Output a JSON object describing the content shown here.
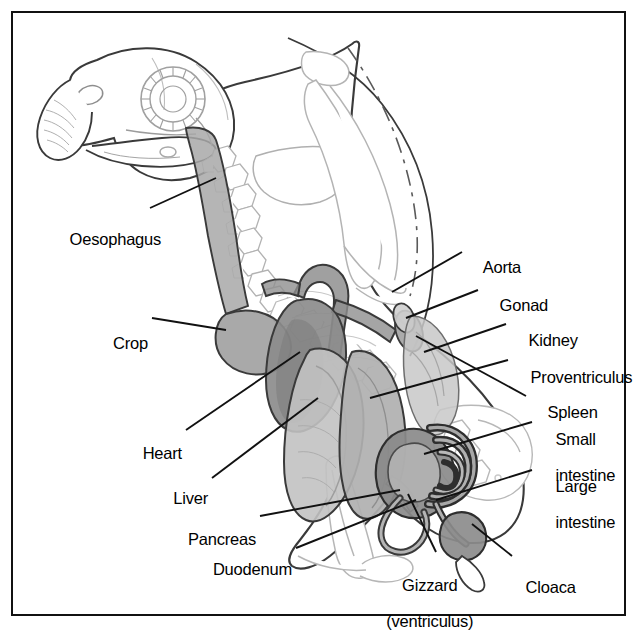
{
  "figure": {
    "frame_color": "#111111",
    "background": "#ffffff",
    "label_color": "#000000"
  },
  "palette": {
    "outline_dark": "#3a3a3a",
    "skeleton_line": "#b9b9b9",
    "organ_dark": "#8f8f8f",
    "organ_mid": "#a8a8a8",
    "organ_light": "#c4c4c4",
    "organ_pale": "#d8d8d8",
    "leader_line": "#111111"
  },
  "labels": [
    {
      "id": "oesophagus",
      "text": "Oesophagus",
      "side": "left",
      "x": 52,
      "y": 212,
      "lines": [
        "Oesophagus"
      ]
    },
    {
      "id": "crop",
      "text": "Crop",
      "side": "left",
      "x": 107,
      "y": 316,
      "lines": [
        "Crop"
      ]
    },
    {
      "id": "heart",
      "text": "Heart",
      "side": "left",
      "x": 140,
      "y": 435,
      "lines": [
        "Heart"
      ]
    },
    {
      "id": "liver",
      "text": "Liver",
      "side": "left",
      "x": 168,
      "y": 479,
      "lines": [
        "Liver"
      ]
    },
    {
      "id": "pancreas",
      "text": "Pancreas",
      "side": "left",
      "x": 192,
      "y": 521,
      "lines": [
        "Pancreas"
      ]
    },
    {
      "id": "duodenum",
      "text": "Duodenum",
      "side": "left",
      "x": 222,
      "y": 551,
      "lines": [
        "Duodenum"
      ]
    },
    {
      "id": "aorta",
      "text": "Aorta",
      "side": "right",
      "x": 466,
      "y": 247,
      "lines": [
        "Aorta"
      ]
    },
    {
      "id": "gonad",
      "text": "Gonad",
      "side": "right",
      "x": 482,
      "y": 285,
      "lines": [
        "Gonad"
      ]
    },
    {
      "id": "kidney",
      "text": "Kidney",
      "side": "right",
      "x": 511,
      "y": 320,
      "lines": [
        "Kidney"
      ]
    },
    {
      "id": "proventriculus",
      "text": "Proventriculus",
      "side": "right",
      "x": 513,
      "y": 357,
      "lines": [
        "Proventriculus"
      ]
    },
    {
      "id": "spleen",
      "text": "Spleen",
      "side": "right",
      "x": 530,
      "y": 392,
      "lines": [
        "Spleen"
      ]
    },
    {
      "id": "small-intestine",
      "text": "Small intestine",
      "side": "right",
      "x": 538,
      "y": 418,
      "lines": [
        "Small",
        "intestine"
      ]
    },
    {
      "id": "large-intestine",
      "text": "Large intestine",
      "side": "right",
      "x": 538,
      "y": 465,
      "lines": [
        "Large",
        "intestine"
      ]
    },
    {
      "id": "gizzard",
      "text": "Gizzard (ventriculus)",
      "side": "bottom",
      "x": 420,
      "y": 563,
      "lines": [
        "Gizzard",
        "(ventriculus)"
      ]
    },
    {
      "id": "cloaca",
      "text": "Cloaca",
      "side": "bottom",
      "x": 508,
      "y": 568,
      "lines": [
        "Cloaca"
      ]
    }
  ],
  "organs": [
    {
      "id": "oesophagus-tube",
      "name": "Oesophagus",
      "tone": "organ_mid"
    },
    {
      "id": "crop-sac",
      "name": "Crop",
      "tone": "organ_mid"
    },
    {
      "id": "heart-mass",
      "name": "Heart",
      "tone": "organ_dark"
    },
    {
      "id": "liver-lobes",
      "name": "Liver",
      "tone": "organ_light"
    },
    {
      "id": "proventriculus-body",
      "name": "Proventriculus",
      "tone": "organ_mid"
    },
    {
      "id": "gizzard-body",
      "name": "Gizzard",
      "tone": "organ_dark"
    },
    {
      "id": "small-intestine-coil",
      "name": "Small intestine",
      "tone": "organ_dark"
    },
    {
      "id": "large-intestine-loop",
      "name": "Large intestine",
      "tone": "organ_mid"
    },
    {
      "id": "cloaca-bulb",
      "name": "Cloaca",
      "tone": "organ_dark"
    },
    {
      "id": "kidney-body",
      "name": "Kidney",
      "tone": "organ_light"
    },
    {
      "id": "gonad-oval",
      "name": "Gonad",
      "tone": "organ_light"
    },
    {
      "id": "spleen-body",
      "name": "Spleen",
      "tone": "organ_mid"
    },
    {
      "id": "aorta-vessel",
      "name": "Aorta",
      "tone": "organ_dark"
    },
    {
      "id": "pancreas-strip",
      "name": "Pancreas",
      "tone": "organ_light"
    },
    {
      "id": "duodenum-loop",
      "name": "Duodenum",
      "tone": "organ_mid"
    }
  ],
  "skeleton": [
    {
      "id": "skull",
      "name": "Skull with hooked beak"
    },
    {
      "id": "sclerotic-ring",
      "name": "Sclerotic ring (eye)"
    },
    {
      "id": "cervical-spine",
      "name": "Cervical vertebrae"
    },
    {
      "id": "sternum-keel",
      "name": "Sternum / keel"
    },
    {
      "id": "wing-bones",
      "name": "Wing bones"
    },
    {
      "id": "ribs",
      "name": "Ribs"
    },
    {
      "id": "pelvis-synsacrum",
      "name": "Pelvis / synsacrum"
    },
    {
      "id": "leg-bones",
      "name": "Femur and tibiotarsus"
    },
    {
      "id": "body-outline",
      "name": "Body contour"
    }
  ]
}
